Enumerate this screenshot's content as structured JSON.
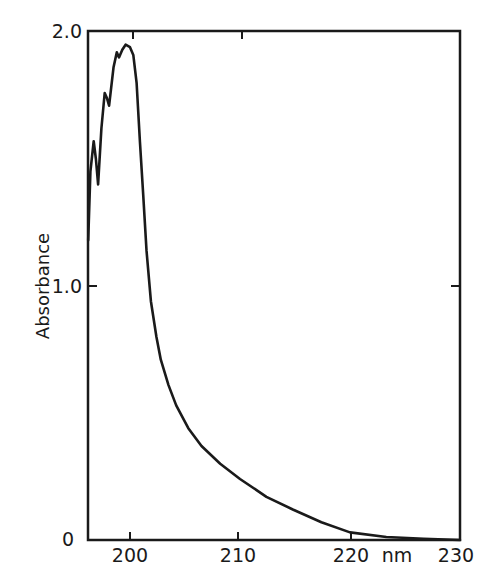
{
  "chart_data": {
    "type": "line",
    "title": "",
    "xlabel": "nm",
    "ylabel": "Absorbance",
    "xlim": [
      196.1,
      230
    ],
    "ylim": [
      0,
      2.0
    ],
    "grid": false,
    "legend": null,
    "x_ticks": [
      200,
      210,
      220,
      230
    ],
    "x_tick_labels": [
      "200",
      "210",
      "220",
      "230"
    ],
    "y_ticks": [
      0,
      1.0,
      2.0
    ],
    "y_tick_labels": [
      "0",
      "1.0",
      "2.0"
    ],
    "series": [
      {
        "name": "Absorbance spectrum",
        "color": "#1a1a1a",
        "x": [
          196.2,
          196.4,
          196.7,
          196.9,
          197.1,
          197.4,
          197.7,
          197.9,
          198.1,
          198.5,
          198.8,
          199.0,
          199.3,
          199.6,
          200.0,
          200.3,
          200.6,
          200.9,
          201.2,
          201.5,
          201.9,
          202.4,
          202.8,
          203.5,
          204.2,
          205.3,
          206.5,
          208.2,
          210.0,
          212.4,
          214.8,
          217.4,
          220.0,
          223.3,
          226.7,
          230.0
        ],
        "y": [
          1.18,
          1.45,
          1.57,
          1.5,
          1.4,
          1.62,
          1.76,
          1.74,
          1.71,
          1.86,
          1.92,
          1.9,
          1.93,
          1.95,
          1.94,
          1.91,
          1.8,
          1.57,
          1.36,
          1.14,
          0.94,
          0.8,
          0.71,
          0.61,
          0.53,
          0.44,
          0.37,
          0.3,
          0.24,
          0.17,
          0.12,
          0.07,
          0.03,
          0.012,
          0.005,
          0.0
        ]
      }
    ]
  },
  "labels": {
    "y_axis_title": "Absorbance",
    "x_unit": "nm",
    "y_tick_2": "2.0",
    "y_tick_1": "1.0",
    "y_tick_0": "0",
    "x_tick_200": "200",
    "x_tick_210": "210",
    "x_tick_220": "220",
    "x_tick_230": "230"
  },
  "colors": {
    "ink": "#1a1a1a",
    "background": "#ffffff"
  }
}
